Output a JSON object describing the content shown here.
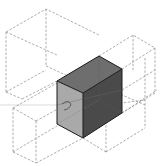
{
  "diagram": {
    "title": "",
    "colors": {
      "background": "#ffffff",
      "top_face": "#6e6e6e",
      "left_face": "#a9a9a9",
      "right_face": "#4a4a4a",
      "edges": "#1a1a1a",
      "dashed_lines": "#8a8a8a",
      "axis_line": "#c2c2c2"
    },
    "solid_box": {
      "top_face": [
        [
          99,
          56
        ],
        [
          122,
          69
        ],
        [
          83,
          93
        ],
        [
          57,
          81
        ]
      ],
      "left_face": [
        [
          57,
          81
        ],
        [
          83,
          93
        ],
        [
          83,
          138
        ],
        [
          57,
          124
        ]
      ],
      "right_face": [
        [
          83,
          93
        ],
        [
          122,
          69
        ],
        [
          122,
          113
        ],
        [
          83,
          138
        ]
      ]
    },
    "annotations": {
      "arc_symbol": "rotation-arc"
    }
  }
}
